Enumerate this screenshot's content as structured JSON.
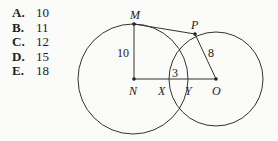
{
  "choices": [
    {
      "letter": "A.",
      "value": "10"
    },
    {
      "letter": "B.",
      "value": "11"
    },
    {
      "letter": "C.",
      "value": "12"
    },
    {
      "letter": "D.",
      "value": "15"
    },
    {
      "letter": "E.",
      "value": "18"
    }
  ],
  "diagram": {
    "points": {
      "M": "M",
      "P": "P",
      "N": "N",
      "X": "X",
      "Y": "Y",
      "O": "O"
    },
    "lengths": {
      "MN": "10",
      "PO": "8",
      "XY": "3"
    }
  }
}
